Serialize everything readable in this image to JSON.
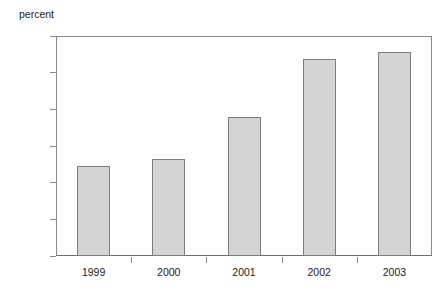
{
  "chart_data": {
    "type": "bar",
    "title": "",
    "subtitle": "",
    "xlabel": "",
    "ylabel": "percent",
    "categories": [
      "1999",
      "2000",
      "2001",
      "2002",
      "2003"
    ],
    "values": [
      7.73,
      7.82,
      8.4,
      9.18,
      9.28
    ],
    "ylim": [
      6.5,
      9.5
    ],
    "ytick_values": [
      6.5,
      7.0,
      7.5,
      8.0,
      8.5,
      9.0,
      9.5
    ],
    "ytick_labels": [
      "6.5",
      "7.0",
      "7.5",
      "8.0",
      "8.5",
      "9.0",
      "9.5"
    ],
    "grid": false,
    "legend": null,
    "legend_position": "none",
    "bar_fill_color": "#d4d4d4",
    "bar_border_color": "#7d7d7d",
    "axis_color": "#8a8a8a",
    "background_color": "#ffffff"
  }
}
